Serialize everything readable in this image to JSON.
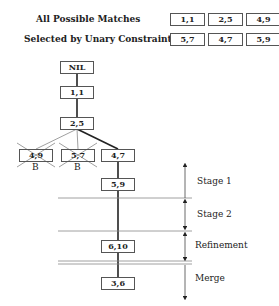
{
  "header": {
    "all_matches_label": "All Possible Matches",
    "unary_label": "Selected by Unary Constraints:",
    "all_matches": [
      "1,1",
      "2,5",
      "4,9"
    ],
    "unary_selected": [
      "5,7",
      "4,7",
      "5,9"
    ]
  },
  "tree": {
    "root": "NIL",
    "level1": "1,1",
    "level2": "2,5",
    "children": [
      {
        "label": "4,9",
        "pruned": true,
        "mark": "B"
      },
      {
        "label": "5,7",
        "pruned": true,
        "mark": "B"
      },
      {
        "label": "4,7",
        "pruned": false,
        "mark": ""
      }
    ],
    "stage1_node": "5,9",
    "refinement_node": "6,10",
    "merge_node": "3,6"
  },
  "stages": [
    "Stage 1",
    "Stage 2",
    "Refinement",
    "Merge"
  ]
}
